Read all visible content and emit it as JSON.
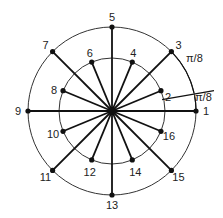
{
  "diagram": {
    "center": [
      112,
      111
    ],
    "outer_radius": 84,
    "inner_radius": 53,
    "points": [
      {
        "label": "1",
        "ring": "outer",
        "angle_index": 0
      },
      {
        "label": "2",
        "ring": "inner",
        "angle_index": 1
      },
      {
        "label": "3",
        "ring": "outer",
        "angle_index": 2
      },
      {
        "label": "4",
        "ring": "inner",
        "angle_index": 3
      },
      {
        "label": "5",
        "ring": "outer",
        "angle_index": 4
      },
      {
        "label": "6",
        "ring": "inner",
        "angle_index": 5
      },
      {
        "label": "7",
        "ring": "outer",
        "angle_index": 6
      },
      {
        "label": "8",
        "ring": "inner",
        "angle_index": 7
      },
      {
        "label": "9",
        "ring": "outer",
        "angle_index": 8
      },
      {
        "label": "10",
        "ring": "inner",
        "angle_index": 9
      },
      {
        "label": "11",
        "ring": "outer",
        "angle_index": 10
      },
      {
        "label": "12",
        "ring": "inner",
        "angle_index": 11
      },
      {
        "label": "13",
        "ring": "outer",
        "angle_index": 12
      },
      {
        "label": "14",
        "ring": "inner",
        "angle_index": 13
      },
      {
        "label": "15",
        "ring": "outer",
        "angle_index": 14
      },
      {
        "label": "16",
        "ring": "inner",
        "angle_index": 15
      }
    ],
    "angle_annotations": [
      "π/8",
      "π/8"
    ]
  }
}
